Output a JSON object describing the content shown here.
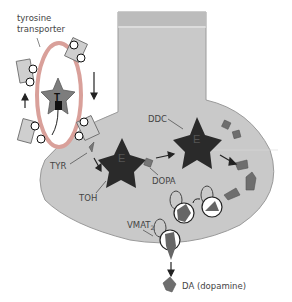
{
  "diagram": {
    "labels": {
      "transporter_line1": "tyrosine",
      "transporter_line2": "transporter",
      "tyr": "TYR",
      "toh": "TOH",
      "ddc": "DDC",
      "dopa": "DOPA",
      "vmat": "VMAT",
      "vmat_sub": "2",
      "dopamine": "DA (dopamine)",
      "enzyme1": "E",
      "enzyme2": "E",
      "transporter_symbol": "T"
    },
    "colors": {
      "terminal_fill": "#c8c8c8",
      "terminal_stroke": "#999999",
      "axon_fill": "#bdbdbd",
      "transporter_ring": "#d9a09a",
      "enzyme": "#2a2a2a",
      "molecule": "#6e6e6e",
      "transporter_body": "#8a8a8a"
    }
  }
}
